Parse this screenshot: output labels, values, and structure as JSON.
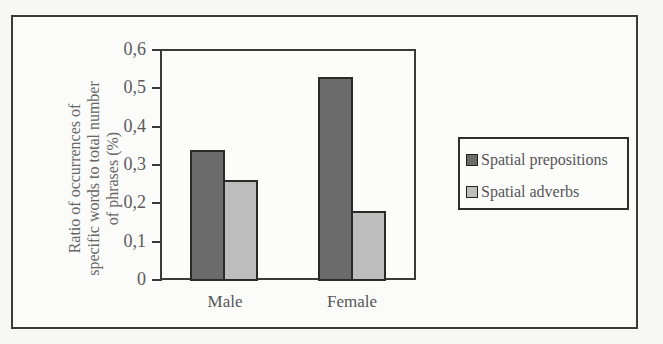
{
  "chart_data": {
    "type": "bar",
    "title": "",
    "xlabel": "",
    "ylabel": "Ratio of occurrences of specific words to total number of phrases (%)",
    "ylabel_lines": [
      "Ratio of occurrences of",
      "specific words to total number",
      "of phrases (%)"
    ],
    "categories": [
      "Male",
      "Female"
    ],
    "series": [
      {
        "name": "Spatial prepositions",
        "values": [
          0.34,
          0.53
        ],
        "color": "#6b6b6b"
      },
      {
        "name": "Spatial adverbs",
        "values": [
          0.26,
          0.18
        ],
        "color": "#bdbdbd"
      }
    ],
    "ylim": [
      0,
      0.6
    ],
    "yticks": [
      "0",
      "0,1",
      "0,2",
      "0,3",
      "0,4",
      "0,5",
      "0,6"
    ],
    "grid": false,
    "legend_position": "right"
  }
}
